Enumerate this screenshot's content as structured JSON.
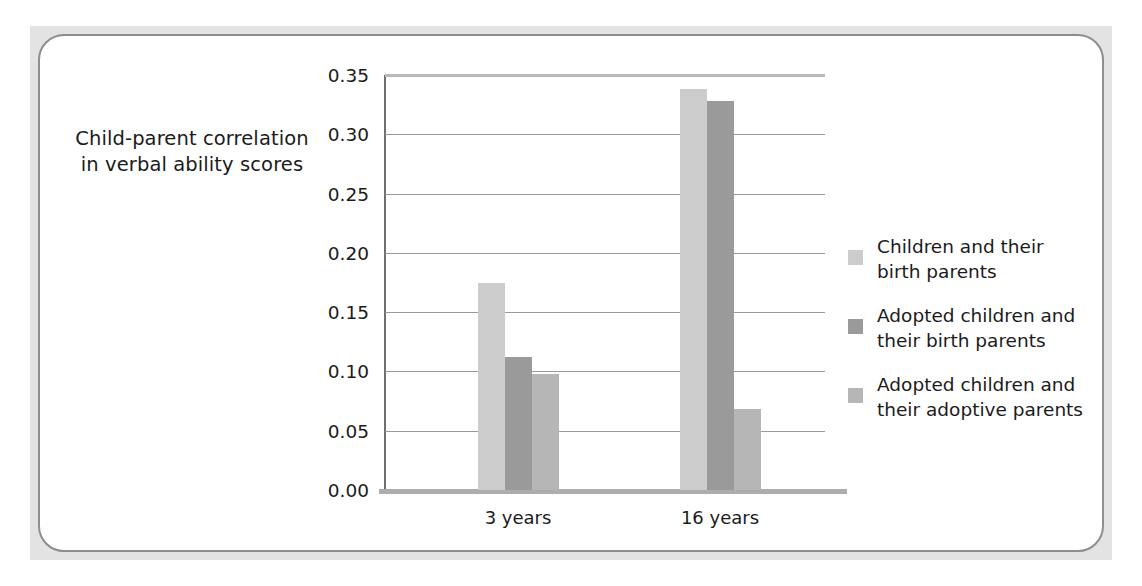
{
  "figure": {
    "y_axis_title": "Child-parent correlation\nin verbal ability scores"
  },
  "chart_data": {
    "type": "bar",
    "title": "",
    "xlabel": "",
    "ylabel": "Child-parent correlation in verbal ability scores",
    "categories": [
      "3 years",
      "16 years"
    ],
    "series": [
      {
        "name": "Children and their birth parents",
        "color": "#cccccc",
        "values": [
          0.175,
          0.338
        ]
      },
      {
        "name": "Adopted children and their birth parents",
        "color": "#9a9a9a",
        "values": [
          0.112,
          0.328
        ]
      },
      {
        "name": "Adopted children and their adoptive parents",
        "color": "#b6b6b6",
        "values": [
          0.098,
          0.068
        ]
      }
    ],
    "ylim": [
      0.0,
      0.35
    ],
    "ytick_labels": [
      "0.35",
      "0.30",
      "0.25",
      "0.20",
      "0.15",
      "0.10",
      "0.05",
      "0.00"
    ],
    "ytick_values": [
      0.35,
      0.3,
      0.25,
      0.2,
      0.15,
      0.1,
      0.05,
      0.0
    ],
    "grid": true,
    "legend_position": "right"
  },
  "legend": {
    "entries": [
      {
        "label_line1": "Children and their",
        "label_line2": "birth parents",
        "color": "#cccccc"
      },
      {
        "label_line1": "Adopted children and",
        "label_line2": "their birth parents",
        "color": "#9a9a9a"
      },
      {
        "label_line1": "Adopted children and",
        "label_line2": "their adoptive parents",
        "color": "#b6b6b6"
      }
    ]
  },
  "axis": {
    "y_title_line1": "Child-parent correlation",
    "y_title_line2": "in verbal ability scores"
  }
}
